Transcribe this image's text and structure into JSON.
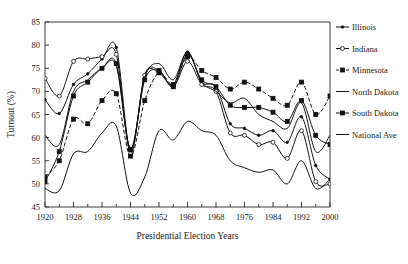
{
  "chart_data": {
    "type": "line",
    "title": "",
    "xlabel": "Presidential Election Years",
    "ylabel": "Turnout (%)",
    "xlim": [
      1920,
      2000
    ],
    "ylim": [
      45,
      85
    ],
    "yticks": [
      45,
      50,
      55,
      60,
      65,
      70,
      75,
      80,
      85
    ],
    "xticks_major": [
      1920,
      1928,
      1936,
      1944,
      1952,
      1960,
      1968,
      1976,
      1984,
      1992,
      2000
    ],
    "xticks_minor": [
      1924,
      1932,
      1940,
      1948,
      1956,
      1964,
      1972,
      1980,
      1988,
      1996
    ],
    "grid": false,
    "legend_position": "right",
    "x": [
      1920,
      1924,
      1928,
      1932,
      1936,
      1940,
      1944,
      1948,
      1952,
      1956,
      1960,
      1964,
      1968,
      1972,
      1976,
      1980,
      1984,
      1988,
      1992,
      1996,
      2000
    ],
    "series": [
      {
        "name": "Illinois",
        "marker": "small-filled-circle",
        "dash": "solid",
        "values": [
          68.2,
          65.2,
          71.5,
          73.8,
          77.0,
          79.5,
          57.0,
          73.5,
          74.0,
          71.5,
          78.5,
          72.0,
          71.0,
          63.0,
          62.0,
          60.5,
          61.5,
          59.0,
          64.5,
          54.0,
          51.0
        ]
      },
      {
        "name": "Indiana",
        "marker": "open-circle",
        "dash": "solid",
        "values": [
          72.8,
          69.0,
          76.5,
          77.0,
          77.5,
          78.0,
          56.5,
          73.5,
          74.5,
          71.0,
          76.5,
          71.5,
          70.0,
          61.0,
          60.5,
          58.5,
          59.0,
          55.5,
          61.5,
          50.5,
          50.0
        ]
      },
      {
        "name": "Minnesota",
        "marker": "filled-square",
        "dash": "dashed",
        "values": [
          51.5,
          55.0,
          64.0,
          63.0,
          68.0,
          69.5,
          56.0,
          68.0,
          74.0,
          71.5,
          77.5,
          74.5,
          73.0,
          70.5,
          72.0,
          70.5,
          68.5,
          67.0,
          72.0,
          65.0,
          69.0
        ]
      },
      {
        "name": "North Dakota",
        "marker": "none",
        "dash": "solid",
        "values": [
          60.5,
          58.5,
          70.0,
          72.5,
          75.0,
          75.5,
          57.5,
          73.0,
          76.0,
          72.5,
          78.5,
          72.0,
          70.0,
          67.5,
          68.5,
          65.0,
          63.5,
          62.0,
          67.5,
          57.0,
          60.5
        ]
      },
      {
        "name": "South Dakota",
        "marker": "filled-square",
        "dash": "solid",
        "values": [
          50.5,
          57.0,
          69.0,
          72.0,
          75.0,
          76.0,
          57.5,
          72.5,
          74.5,
          71.0,
          78.0,
          72.5,
          71.0,
          67.0,
          66.5,
          66.5,
          65.5,
          63.5,
          68.0,
          60.5,
          58.5
        ]
      },
      {
        "name": "National Ave",
        "marker": "none",
        "dash": "solid",
        "values": [
          49.0,
          48.5,
          56.5,
          57.0,
          61.0,
          62.5,
          48.0,
          51.5,
          61.5,
          59.5,
          63.5,
          61.5,
          60.5,
          55.0,
          53.5,
          52.5,
          53.0,
          50.0,
          55.0,
          49.0,
          51.0
        ]
      }
    ]
  },
  "legend": {
    "items": [
      {
        "label": "Illinois"
      },
      {
        "label": "Indiana"
      },
      {
        "label": "Minnesota"
      },
      {
        "label": "North Dakota"
      },
      {
        "label": "South Dakota"
      },
      {
        "label": "National Ave"
      }
    ]
  }
}
